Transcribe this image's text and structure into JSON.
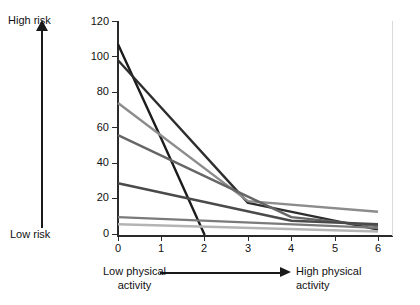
{
  "axes": {
    "y_label_high": "High risk",
    "y_label_low": "Low risk",
    "x_label_low_1": "Low physical",
    "x_label_low_2": "activity",
    "x_label_high_1": "High physical",
    "x_label_high_2": "activity",
    "y_ticks": [
      "120",
      "100",
      "80",
      "60",
      "40",
      "20",
      "0"
    ],
    "x_ticks": [
      "0",
      "1",
      "2",
      "3",
      "4",
      "5",
      "6"
    ]
  },
  "colors": {
    "axis": "#2a2a2a",
    "text": "#111111",
    "frame": "#d9d9d9",
    "series_1": "#1c1c1c",
    "series_2": "#2e2e2e",
    "series_3": "#8c8c8c",
    "series_4": "#666666",
    "series_5": "#4a4a4a",
    "series_6": "#7a7a7a",
    "series_7": "#b4b4b4"
  },
  "chart_data": {
    "type": "line",
    "title": "",
    "xlabel": "Low physical activity → High physical activity",
    "ylabel": "Low risk → High risk",
    "xlim": [
      0,
      6
    ],
    "ylim": [
      0,
      120
    ],
    "yticks": [
      0,
      20,
      40,
      60,
      80,
      100,
      120
    ],
    "xticks": [
      0,
      1,
      2,
      3,
      4,
      5,
      6
    ],
    "grid": false,
    "legend": "none",
    "x": [
      0,
      1,
      2,
      3,
      4,
      5,
      6
    ],
    "series": [
      {
        "name": "series-1",
        "color": "#1c1c1c",
        "x": [
          0,
          1,
          2
        ],
        "values": [
          107,
          54,
          0
        ],
        "comment": "steepest dark line, drops to zero at x=2"
      },
      {
        "name": "series-2",
        "color": "#2e2e2e",
        "x": [
          0,
          3,
          6
        ],
        "values": [
          98,
          18,
          3
        ],
        "comment": "dark line with kink at x=3"
      },
      {
        "name": "series-3",
        "color": "#8c8c8c",
        "x": [
          0,
          3,
          6
        ],
        "values": [
          74,
          19,
          13
        ],
        "comment": "mid-grey line, highest at right edge"
      },
      {
        "name": "series-4",
        "color": "#666666",
        "x": [
          0,
          4,
          6
        ],
        "values": [
          56,
          10,
          5
        ],
        "comment": "grey line"
      },
      {
        "name": "series-5",
        "color": "#4a4a4a",
        "x": [
          0,
          4,
          6
        ],
        "values": [
          29,
          8,
          6
        ],
        "comment": "dark grey shallow line"
      },
      {
        "name": "series-6",
        "color": "#7a7a7a",
        "x": [
          0,
          6
        ],
        "values": [
          10,
          4
        ],
        "comment": "near-flat grey line"
      },
      {
        "name": "series-7",
        "color": "#b4b4b4",
        "x": [
          0,
          6
        ],
        "values": [
          6,
          2
        ],
        "comment": "near-flat light grey line"
      }
    ]
  }
}
